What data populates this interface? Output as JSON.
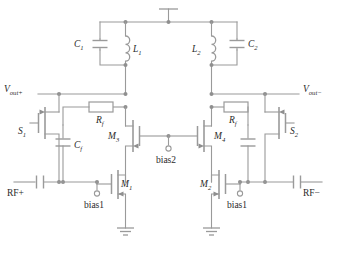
{
  "diagram": {
    "supply_label": "VDD",
    "labels": {
      "c1": "C",
      "c1_sub": "1",
      "l1": "L",
      "l1_sub": "1",
      "c2": "C",
      "c2_sub": "2",
      "l2": "L",
      "l2_sub": "2",
      "vout_p": "V",
      "vout_p_sub": "out+",
      "vout_n": "V",
      "vout_n_sub": "out−",
      "rf_left": "R",
      "rf_left_sub": "f",
      "rf_right": "R",
      "rf_right_sub": "f",
      "cf_left": "C",
      "cf_left_sub": "f",
      "s1": "S",
      "s1_sub": "1",
      "s2": "S",
      "s2_sub": "2",
      "m1": "M",
      "m1_sub": "1",
      "m2": "M",
      "m2_sub": "2",
      "m3": "M",
      "m3_sub": "3",
      "m4": "M",
      "m4_sub": "4",
      "bias1_left": "bias1",
      "bias1_right": "bias1",
      "bias2": "bias2",
      "rf_in_p": "RF+",
      "rf_in_n": "RF−"
    },
    "colors": {
      "wire": "#9a9a9a",
      "node": "#8f8f8f",
      "text": "#2a2a2a",
      "background": "#ffffff"
    }
  }
}
